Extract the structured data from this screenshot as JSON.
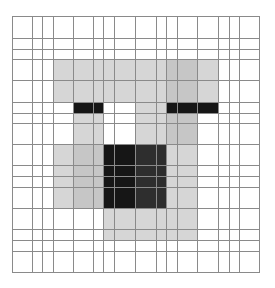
{
  "figure": {
    "col_edges": [
      12,
      32,
      42,
      53,
      73,
      93,
      103,
      114,
      135,
      156,
      166,
      177,
      197,
      218,
      229,
      239,
      259
    ],
    "row_edges": [
      16,
      38,
      49,
      59,
      80,
      102,
      113,
      123,
      144,
      165,
      176,
      187,
      208,
      229,
      240,
      251,
      272
    ],
    "palette": {
      "W": "#ffffff",
      "L": "#d6d6d6",
      "M": "#c6c6c6",
      "D": "#2e2e2e",
      "K": "#161616"
    },
    "grid_line_color": "#8a8a8a",
    "cells": [
      "WWWWWWWWWWWWWWWW",
      "WWWWWWWWWWWWWWWW",
      "WWWWWWWWWWWWWWWW",
      "WWWLLLLLLLMMLWWW",
      "WWWLLLLLLLMMLWWW",
      "WWWWKKWWLLKKKWWW",
      "WWWWLLWWLLMMWWWW",
      "WWWWLLWWLLMMWWWW",
      "WWWLMMKKDDLLWWWW",
      "WWWLMMKKDDLLWWWW",
      "WWWLMMKKDDLLWWWW",
      "WWWLMMKKDDLLWWWW",
      "WWWWWWLLLLLLWWWW",
      "WWWWWWLLLLLLWWWW",
      "WWWWWWWWWWWWWWWW",
      "WWWWWWWWWWWWWWWW"
    ]
  }
}
